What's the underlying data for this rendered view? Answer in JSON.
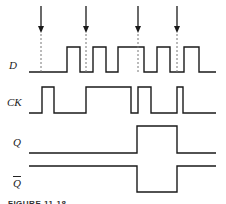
{
  "labels": {
    "d": "D",
    "ck": "CK",
    "q": "Q",
    "qbar": "Q"
  },
  "caption": "FIGURE 11-18",
  "colors": {
    "line": "#1a1a1a",
    "dashed": "#777777"
  },
  "signals": {
    "D": {
      "low_y": 72,
      "high_y": 47,
      "start_x": 29,
      "end_x": 216,
      "starts": "low",
      "transitions": [
        67,
        80,
        93,
        106,
        118,
        144,
        157,
        170,
        184,
        199
      ]
    },
    "CK": {
      "low_y": 113,
      "high_y": 87,
      "start_x": 29,
      "end_x": 216,
      "starts": "low",
      "transitions": [
        42,
        54,
        86,
        131,
        138,
        151,
        177,
        183
      ]
    },
    "Q": {
      "low_y": 153,
      "high_y": 126,
      "start_x": 29,
      "end_x": 216,
      "starts": "low",
      "transitions": [
        137,
        177
      ]
    },
    "Qbar": {
      "low_y": 192,
      "high_y": 166,
      "start_x": 29,
      "end_x": 216,
      "starts": "high",
      "transitions": [
        137,
        177
      ]
    }
  },
  "arrows": [
    41,
    86,
    138,
    177
  ],
  "arrow_top": 6,
  "arrow_tip": 33,
  "dash_bottom": 73
}
